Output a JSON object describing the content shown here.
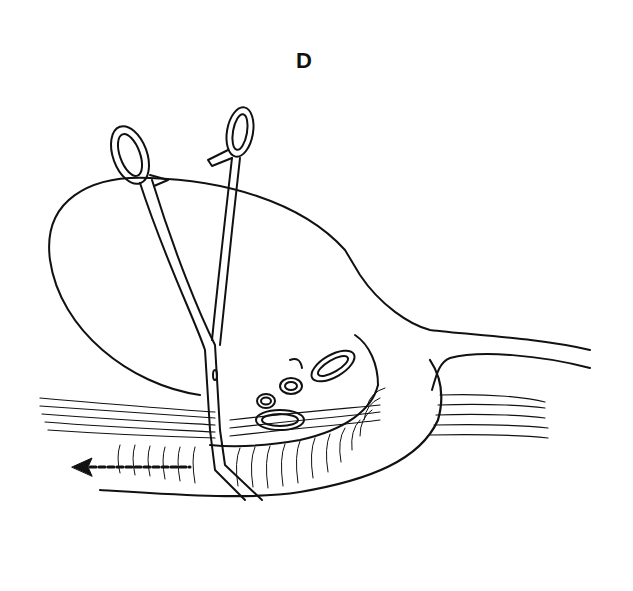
{
  "figure": {
    "panel_label": "D",
    "colors": {
      "ink": "#111111",
      "background": "#ffffff"
    },
    "elements": [
      "oval-organ",
      "duct-extension",
      "muscle-fibers",
      "curved-tube",
      "left-clamp",
      "right-clamp",
      "vessel-loops",
      "traction-arrow"
    ]
  }
}
